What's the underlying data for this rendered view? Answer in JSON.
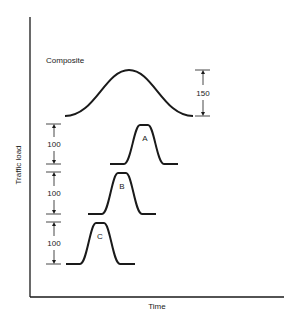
{
  "diagram": {
    "axes": {
      "y_label": "Traffic load",
      "x_label": "Time"
    },
    "composite": {
      "label": "Composite",
      "height_label": "150"
    },
    "curves": [
      {
        "name": "A",
        "height_label": "100"
      },
      {
        "name": "B",
        "height_label": "100"
      },
      {
        "name": "C",
        "height_label": "100"
      }
    ],
    "colors": {
      "line": "#1a1a1a",
      "background": "#ffffff"
    }
  }
}
